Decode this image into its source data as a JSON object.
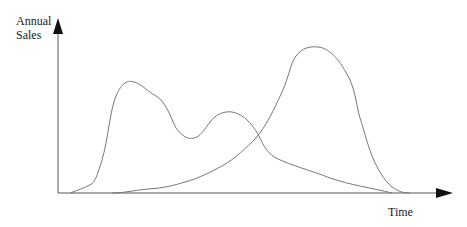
{
  "diagram": {
    "y_axis_label_line1": "Annual",
    "y_axis_label_line2": "Sales",
    "x_axis_label": "Time",
    "colors": {
      "axis": "#555555",
      "arrow": "#111111",
      "curve": "#777777",
      "text": "#222222",
      "background": "#ffffff"
    },
    "curves": [
      {
        "name": "early-double-peak-curve",
        "description": "Rises early to first peak, dips, second smaller peak, then long decline"
      },
      {
        "name": "late-single-peak-curve",
        "description": "Slow rise, then steep rise to large peak, then steep decline"
      }
    ]
  }
}
